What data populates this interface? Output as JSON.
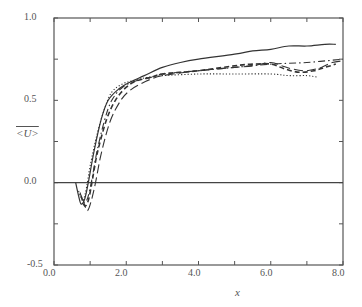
{
  "chart_data": {
    "type": "line",
    "title": "",
    "xlabel": "x",
    "ylabel": "<U>",
    "xlim": [
      0.0,
      8.0
    ],
    "ylim": [
      -0.5,
      1.0
    ],
    "xticks": [
      "0.0",
      "2.0",
      "4.0",
      "6.0",
      "8.0"
    ],
    "yticks": [
      "-0.5",
      "0.0",
      "0.5",
      "1.0"
    ],
    "minor_xticks": [
      1.0,
      3.0,
      5.0,
      7.0
    ],
    "minor_yticks": [
      -0.25,
      0.25,
      0.75
    ],
    "grid": false,
    "legend": null,
    "reference_line": {
      "y": 0.0,
      "style": "solid"
    },
    "series": [
      {
        "name": "solid",
        "style": "solid",
        "x": [
          0.6,
          0.68,
          0.75,
          0.85,
          0.95,
          1.1,
          1.3,
          1.5,
          1.8,
          2.1,
          2.5,
          3.0,
          3.5,
          4.0,
          5.0,
          5.5,
          6.0,
          6.5,
          7.0,
          7.5,
          7.8
        ],
        "y": [
          0.0,
          -0.08,
          -0.13,
          -0.1,
          0.0,
          0.18,
          0.38,
          0.5,
          0.57,
          0.61,
          0.65,
          0.7,
          0.73,
          0.75,
          0.78,
          0.8,
          0.81,
          0.83,
          0.83,
          0.84,
          0.84
        ]
      },
      {
        "name": "dotted",
        "style": "dotted",
        "x": [
          0.68,
          0.75,
          0.82,
          0.9,
          1.0,
          1.2,
          1.4,
          1.6,
          1.9,
          2.2,
          2.6,
          3.0,
          4.0,
          5.0,
          6.0,
          6.5,
          7.0,
          7.3
        ],
        "y": [
          -0.05,
          -0.09,
          -0.1,
          -0.03,
          0.1,
          0.3,
          0.45,
          0.55,
          0.6,
          0.62,
          0.64,
          0.65,
          0.66,
          0.66,
          0.66,
          0.65,
          0.65,
          0.64
        ]
      },
      {
        "name": "dash-dot",
        "style": "dashdot",
        "x": [
          0.72,
          0.8,
          0.87,
          0.95,
          1.05,
          1.2,
          1.4,
          1.6,
          1.9,
          2.3,
          2.7,
          3.0,
          4.0,
          5.0,
          6.0,
          7.0,
          8.0
        ],
        "y": [
          -0.06,
          -0.11,
          -0.12,
          -0.08,
          0.02,
          0.2,
          0.38,
          0.5,
          0.58,
          0.62,
          0.64,
          0.66,
          0.68,
          0.7,
          0.72,
          0.73,
          0.75
        ]
      },
      {
        "name": "medium-dash",
        "style": "dashed",
        "x": [
          0.75,
          0.82,
          0.88,
          0.96,
          1.05,
          1.2,
          1.45,
          1.7,
          2.0,
          2.3,
          2.7,
          3.0,
          4.0,
          5.0,
          5.5,
          6.0,
          6.4,
          6.8,
          7.2,
          7.5,
          7.8
        ],
        "y": [
          -0.08,
          -0.13,
          -0.14,
          -0.1,
          0.0,
          0.18,
          0.38,
          0.5,
          0.58,
          0.62,
          0.64,
          0.66,
          0.68,
          0.71,
          0.72,
          0.72,
          0.69,
          0.67,
          0.68,
          0.7,
          0.72
        ]
      },
      {
        "name": "long-dash",
        "style": "longdash",
        "x": [
          0.8,
          0.87,
          0.93,
          1.02,
          1.15,
          1.3,
          1.55,
          1.85,
          2.1,
          2.4,
          2.7,
          3.0,
          4.0,
          5.0,
          5.5,
          6.0,
          6.3,
          6.6,
          7.0,
          7.4,
          7.7,
          8.0
        ],
        "y": [
          -0.1,
          -0.15,
          -0.17,
          -0.12,
          0.0,
          0.17,
          0.37,
          0.5,
          0.56,
          0.6,
          0.63,
          0.65,
          0.68,
          0.7,
          0.71,
          0.73,
          0.71,
          0.69,
          0.68,
          0.7,
          0.73,
          0.74
        ]
      }
    ]
  },
  "axes": {
    "xlabel": "x",
    "ylabel": "<U>",
    "xtick_labels": [
      "0.0",
      "2.0",
      "4.0",
      "6.0",
      "8.0"
    ],
    "ytick_labels": [
      "1.0",
      "0.5",
      "0.0",
      "-0.5"
    ]
  }
}
